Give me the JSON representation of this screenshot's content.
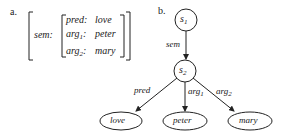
{
  "panel_a": {
    "label": "a.",
    "outer_feature": "sem",
    "inner_rows": [
      {
        "attr": "pred",
        "sub": "",
        "value": "love"
      },
      {
        "attr": "arg",
        "sub": "1",
        "value": "peter"
      },
      {
        "attr": "arg",
        "sub": "2",
        "value": "mary"
      }
    ]
  },
  "panel_b": {
    "label": "b.",
    "nodes": {
      "s1": {
        "name": "s",
        "sub": "1"
      },
      "s2": {
        "name": "s",
        "sub": "2"
      },
      "love": "love",
      "peter": "peter",
      "mary": "mary"
    },
    "edges": {
      "sem": "sem",
      "pred": "pred",
      "arg1": {
        "name": "arg",
        "sub": "1"
      },
      "arg2": {
        "name": "arg",
        "sub": "2"
      }
    }
  }
}
